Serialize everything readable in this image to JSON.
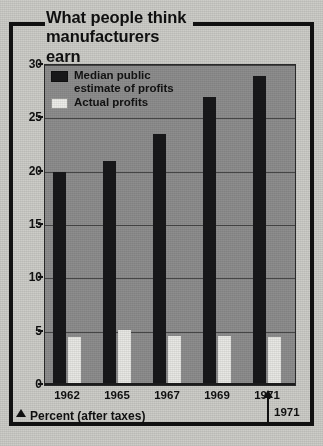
{
  "title": {
    "line1": "What people think",
    "line2": "manufacturers earn"
  },
  "legend": {
    "items": [
      {
        "label": "Median public\nestimate of profits",
        "swatch": "dark",
        "color": "#18181a"
      },
      {
        "label": "Actual profits",
        "swatch": "light",
        "color": "#eeeeea"
      }
    ]
  },
  "footer": {
    "marker_icon": "triangle-up-icon",
    "label": "Percent (after taxes)"
  },
  "annotation": {
    "icon": "arrow-up-icon",
    "label": "1971"
  },
  "colors": {
    "plot_background": "#8e8e8e",
    "page_background": "#cdcdc8",
    "frame": "#121212",
    "median_bar": "#18181a",
    "actual_bar": "#e8e8e4",
    "gridline": "#3a3a3a",
    "text": "#101010"
  },
  "chart_data": {
    "type": "bar",
    "title": "What people think manufacturers earn",
    "xlabel": "Percent (after taxes)",
    "ylabel": "",
    "categories": [
      "1962",
      "1965",
      "1967",
      "1969",
      "1971"
    ],
    "series": [
      {
        "name": "Median public estimate of profits",
        "values": [
          20.0,
          21.0,
          23.5,
          27.0,
          29.0
        ]
      },
      {
        "name": "Actual profits",
        "values": [
          4.5,
          5.2,
          4.6,
          4.6,
          4.5
        ]
      }
    ],
    "ylim": [
      0,
      30
    ],
    "yticks": [
      0,
      5,
      10,
      15,
      20,
      25,
      30
    ],
    "xticklabels": [
      "1962",
      "1965",
      "1967",
      "1969",
      "1971"
    ],
    "grid": true,
    "legend_position": "top-left-inside",
    "annotations": [
      {
        "text": "1971",
        "points_to": "1971",
        "style": "arrow-up"
      }
    ]
  }
}
